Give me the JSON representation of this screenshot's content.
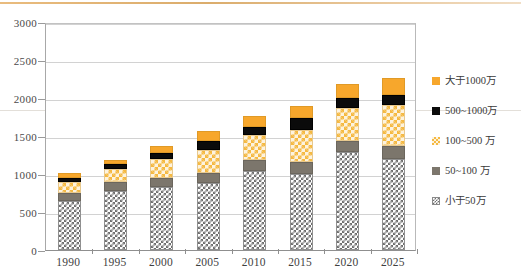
{
  "chart_data": {
    "type": "bar",
    "stacked": true,
    "title": "",
    "xlabel": "",
    "ylabel": "",
    "ylim": [
      0,
      3000
    ],
    "yticks": [
      0,
      500,
      1000,
      1500,
      2000,
      2500,
      3000
    ],
    "grid": true,
    "legend_position": "right",
    "categories": [
      "1990",
      "1995",
      "2000",
      "2005",
      "2010",
      "2015",
      "2020",
      "2025"
    ],
    "series": [
      {
        "name": "小于50万",
        "color": "#6f6f6f",
        "pattern": "checker-gray",
        "values": [
          650,
          780,
          830,
          880,
          1040,
          1000,
          1290,
          1200
        ]
      },
      {
        "name": "50~100 万",
        "color": "#7c766c",
        "pattern": "solid",
        "values": [
          100,
          110,
          120,
          130,
          150,
          160,
          150,
          170
        ]
      },
      {
        "name": "100~500 万",
        "color": "#f5b942",
        "pattern": "checker-orange",
        "values": [
          140,
          170,
          250,
          310,
          320,
          420,
          430,
          540
        ]
      },
      {
        "name": "500~1000万",
        "color": "#0b0b0b",
        "pattern": "solid",
        "values": [
          60,
          70,
          80,
          110,
          110,
          160,
          130,
          130
        ]
      },
      {
        "name": "大于1000万",
        "color": "#f7a72c",
        "pattern": "solid",
        "values": [
          60,
          60,
          90,
          130,
          140,
          150,
          190,
          220
        ]
      }
    ],
    "totals": [
      1010,
      1190,
      1370,
      1560,
      1760,
      1890,
      2190,
      2260
    ]
  },
  "legend": {
    "items": [
      {
        "label": "大于1000万",
        "swatch": "gt1000"
      },
      {
        "label": "500~1000万",
        "swatch": "s500_1000"
      },
      {
        "label": "100~500 万",
        "swatch": "s100_500"
      },
      {
        "label": "50~100 万",
        "swatch": "s50_100"
      },
      {
        "label": "小于50万",
        "swatch": "lt50"
      }
    ]
  }
}
